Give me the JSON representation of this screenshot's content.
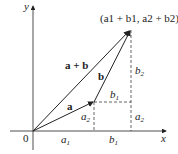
{
  "diagram": {
    "axes": {
      "x_label": "x",
      "y_label": "y",
      "origin_label": "0"
    },
    "vectors": [
      {
        "name": "a",
        "label": "a"
      },
      {
        "name": "b",
        "label": "b"
      },
      {
        "name": "a+b",
        "label": "a + b"
      }
    ],
    "point_label": {
      "text": "(a1 + b1, a2 + b2)"
    },
    "component_labels": {
      "x_a1": "a",
      "x_a1_sub": "1",
      "x_b1": "b",
      "x_b1_sub": "1",
      "inner_a2": "a",
      "inner_a2_sub": "2",
      "inner_b1": "b",
      "inner_b1_sub": "1",
      "right_b2": "b",
      "right_b2_sub": "2",
      "right_a2": "a",
      "right_a2_sub": "2"
    },
    "colors": {
      "line": "#222222",
      "background": "#ffffff"
    }
  }
}
